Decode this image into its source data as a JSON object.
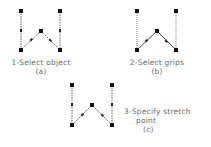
{
  "figures": [
    {
      "id": "a",
      "caption": "1-Select object",
      "tag": "(a)",
      "points": [
        [
          21,
          11
        ],
        [
          21,
          50
        ],
        [
          41,
          31
        ],
        [
          60,
          50
        ],
        [
          60,
          11
        ]
      ]
    },
    {
      "id": "b",
      "caption": "2-Select grips",
      "tag": "(b)",
      "points": [
        [
          137,
          11
        ],
        [
          137,
          50
        ],
        [
          157,
          31
        ],
        [
          176,
          50
        ],
        [
          176,
          11
        ]
      ]
    },
    {
      "id": "c",
      "caption_line1": "3-Specify stretch",
      "caption_line2": "point",
      "tag": "(c)",
      "points": [
        [
          72,
          85
        ],
        [
          72,
          125
        ],
        [
          92,
          105
        ],
        [
          112,
          125
        ],
        [
          112,
          85
        ]
      ]
    }
  ],
  "colors": {
    "line": "#555555",
    "grip": "#111111"
  }
}
